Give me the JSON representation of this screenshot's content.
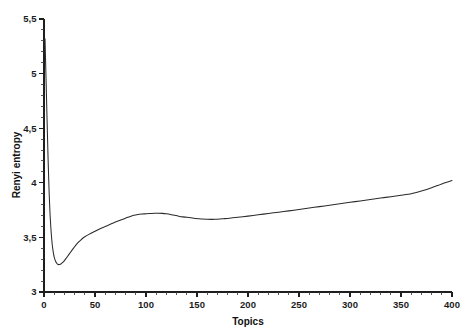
{
  "chart_data": {
    "type": "line",
    "title": "",
    "xlabel": "Topics",
    "ylabel": "Renyi entropy",
    "xlim": [
      0,
      400
    ],
    "ylim": [
      3.0,
      5.5
    ],
    "grid": false,
    "legend": null,
    "decimal_separator": ",",
    "x_ticks": [
      0,
      50,
      100,
      150,
      200,
      250,
      300,
      350,
      400
    ],
    "x_tick_labels": [
      "0",
      "50",
      "100",
      "150",
      "200",
      "250",
      "300",
      "350",
      "400"
    ],
    "x_minor_tick_step": 10,
    "y_ticks": [
      3,
      3.5,
      4,
      4.5,
      5,
      5.5
    ],
    "y_tick_labels": [
      "3",
      "3,5",
      "4",
      "4,5",
      "5",
      "5,5"
    ],
    "y_minor_tick_step": 0.1,
    "line_color": "#2b2b2b",
    "series": [
      {
        "name": "Renyi entropy",
        "x": [
          1,
          2,
          3,
          4,
          5,
          6,
          7,
          8,
          9,
          10,
          11,
          12,
          13,
          14,
          15,
          16,
          17,
          18,
          20,
          22,
          24,
          26,
          28,
          30,
          32,
          34,
          36,
          38,
          40,
          44,
          48,
          52,
          56,
          60,
          64,
          68,
          72,
          76,
          80,
          84,
          88,
          92,
          96,
          100,
          104,
          108,
          112,
          116,
          120,
          124,
          128,
          132,
          136,
          140,
          144,
          148,
          152,
          156,
          160,
          164,
          168,
          172,
          176,
          180,
          190,
          200,
          210,
          220,
          230,
          240,
          250,
          260,
          270,
          280,
          290,
          300,
          310,
          320,
          330,
          340,
          350,
          360,
          370,
          380,
          390,
          400
        ],
        "y": [
          5.32,
          4.95,
          4.58,
          4.22,
          3.92,
          3.7,
          3.55,
          3.44,
          3.37,
          3.32,
          3.29,
          3.27,
          3.258,
          3.252,
          3.251,
          3.254,
          3.26,
          3.268,
          3.288,
          3.312,
          3.338,
          3.364,
          3.39,
          3.414,
          3.438,
          3.458,
          3.476,
          3.492,
          3.506,
          3.528,
          3.548,
          3.566,
          3.583,
          3.599,
          3.616,
          3.632,
          3.647,
          3.662,
          3.676,
          3.69,
          3.702,
          3.71,
          3.714,
          3.716,
          3.718,
          3.721,
          3.722,
          3.72,
          3.716,
          3.71,
          3.702,
          3.694,
          3.688,
          3.684,
          3.679,
          3.673,
          3.67,
          3.668,
          3.666,
          3.665,
          3.666,
          3.668,
          3.671,
          3.674,
          3.684,
          3.695,
          3.707,
          3.719,
          3.731,
          3.743,
          3.756,
          3.769,
          3.782,
          3.795,
          3.808,
          3.821,
          3.834,
          3.847,
          3.86,
          3.873,
          3.886,
          3.9,
          3.925,
          3.955,
          3.99,
          4.02
        ]
      }
    ]
  },
  "axes": {
    "x_axis_name": "x-axis",
    "y_axis_name": "y-axis"
  }
}
